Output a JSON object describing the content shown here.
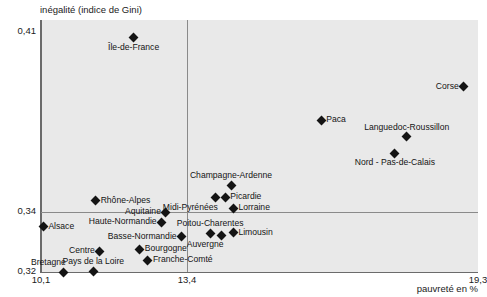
{
  "chart_data": {
    "type": "scatter",
    "title": "",
    "ylabel": "inégalité (indice de Gini)",
    "xlabel": "pauvreté en %",
    "xlim": [
      10.1,
      19.3
    ],
    "ylim": [
      0.32,
      0.41
    ],
    "xticks": [
      "10,1",
      "13,4",
      "19,3"
    ],
    "yticks": [
      "0,32",
      "0,34",
      "0,41"
    ],
    "xtick_values": [
      10.1,
      13.4,
      19.3
    ],
    "ytick_values": [
      0.32,
      0.34,
      0.41
    ],
    "grid": false,
    "legend": "none",
    "reference_lines": {
      "vertical_x": 13.4,
      "horizontal_y": 0.34
    },
    "points": [
      {
        "label": "Île-de-France",
        "x": 12.05,
        "y": 0.4078,
        "pos": "below"
      },
      {
        "label": "Corse",
        "x": 19.0,
        "y": 0.3895,
        "pos": "left"
      },
      {
        "label": "Paca",
        "x": 16.0,
        "y": 0.377,
        "pos": "right"
      },
      {
        "label": "Languedoc-Roussillon",
        "x": 17.8,
        "y": 0.3708,
        "pos": "above"
      },
      {
        "label": "Nord - Pas-de-Calais",
        "x": 17.55,
        "y": 0.3645,
        "pos": "below"
      },
      {
        "label": "Champagne-Ardenne",
        "x": 14.1,
        "y": 0.3525,
        "pos": "above"
      },
      {
        "label": "Picardie",
        "x": 13.98,
        "y": 0.348,
        "pos": "right"
      },
      {
        "label": "Midi-Pyrénées",
        "x": 13.78,
        "y": 0.3478,
        "pos": "below-left"
      },
      {
        "label": "Lorraine",
        "x": 14.15,
        "y": 0.344,
        "pos": "right"
      },
      {
        "label": "Rhône-Alpes",
        "x": 11.25,
        "y": 0.3468,
        "pos": "right"
      },
      {
        "label": "Aquitaine",
        "x": 12.73,
        "y": 0.3425,
        "pos": "left"
      },
      {
        "label": "Haute-Normandie",
        "x": 12.64,
        "y": 0.3387,
        "pos": "left"
      },
      {
        "label": "Alsace",
        "x": 10.15,
        "y": 0.337,
        "pos": "right"
      },
      {
        "label": "Poitou-Charentes",
        "x": 13.66,
        "y": 0.3345,
        "pos": "above"
      },
      {
        "label": "Auvergne",
        "x": 13.9,
        "y": 0.3338,
        "pos": "below-left"
      },
      {
        "label": "Limousin",
        "x": 14.15,
        "y": 0.3348,
        "pos": "right"
      },
      {
        "label": "Basse-Normandie",
        "x": 13.06,
        "y": 0.3333,
        "pos": "left"
      },
      {
        "label": "Bourgogne",
        "x": 12.18,
        "y": 0.3285,
        "pos": "right"
      },
      {
        "label": "Centre",
        "x": 11.34,
        "y": 0.3278,
        "pos": "left"
      },
      {
        "label": "Franche-Comté",
        "x": 12.35,
        "y": 0.3245,
        "pos": "right"
      },
      {
        "label": "Pays de la Loire",
        "x": 11.2,
        "y": 0.3203,
        "pos": "above"
      },
      {
        "label": "Bretagne",
        "x": 10.58,
        "y": 0.32,
        "pos": "above-left"
      }
    ]
  },
  "colors": {
    "plot_background": "#e9e9e9",
    "marker": "#141414",
    "axis": "#6b6b6b",
    "reference_line": "#8a8a8a",
    "text": "#1a1a1a"
  }
}
